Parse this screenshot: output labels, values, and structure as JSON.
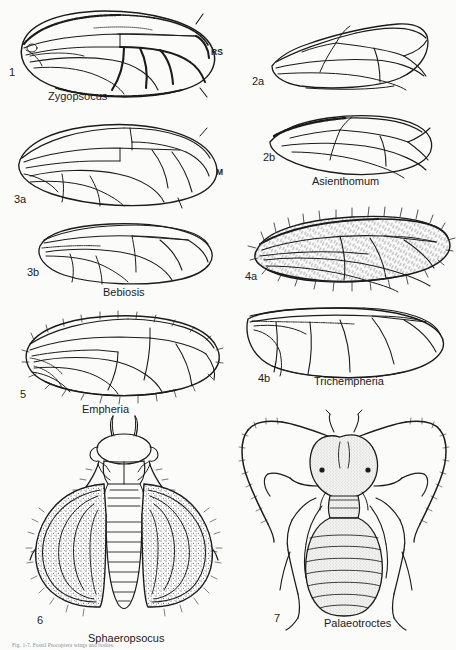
{
  "plate": {
    "background_color": "#fbfbfa",
    "ink_color": "#1b1b1b",
    "width": 456,
    "height": 650,
    "caption_partial": "Fig. 1-7.  Fossil Psocoptera wings and bodies."
  },
  "figures": [
    {
      "id": "fig1",
      "number": "1",
      "taxon": "Zygopsocus",
      "kind": "wing",
      "vein_labels": [
        {
          "text": "RS"
        }
      ]
    },
    {
      "id": "fig2a",
      "number": "2a",
      "taxon": "",
      "kind": "wing",
      "vein_labels": []
    },
    {
      "id": "fig2b",
      "number": "2b",
      "taxon": "Asienthomum",
      "kind": "wing",
      "vein_labels": []
    },
    {
      "id": "fig3a",
      "number": "3a",
      "taxon": "",
      "kind": "wing",
      "vein_labels": [
        {
          "text": "M"
        }
      ]
    },
    {
      "id": "fig3b",
      "number": "3b",
      "taxon": "Bebiosis",
      "kind": "wing",
      "vein_labels": []
    },
    {
      "id": "fig4a",
      "number": "4a",
      "taxon": "",
      "kind": "wing-setose",
      "vein_labels": []
    },
    {
      "id": "fig4b",
      "number": "4b",
      "taxon": "Trichempheria",
      "kind": "wing",
      "vein_labels": []
    },
    {
      "id": "fig5",
      "number": "5",
      "taxon": "Empheria",
      "kind": "wing-setose",
      "vein_labels": []
    },
    {
      "id": "fig6",
      "number": "6",
      "taxon": "Sphaeropsocus",
      "kind": "whole-body-winged",
      "vein_labels": []
    },
    {
      "id": "fig7",
      "number": "7",
      "taxon": "Palaeotroctes",
      "kind": "whole-body-wingless",
      "vein_labels": []
    }
  ]
}
